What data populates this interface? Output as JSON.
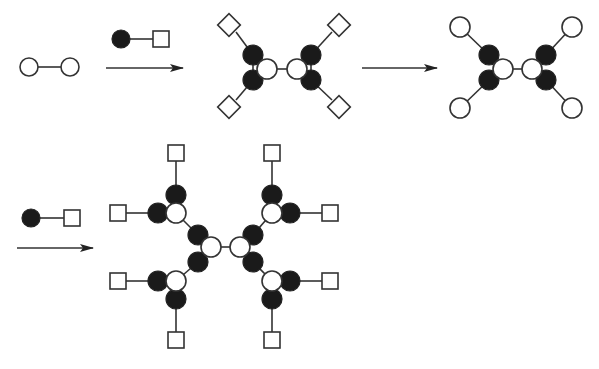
{
  "diagram": {
    "title": "",
    "legend": {
      "open_circle": "core / reactive site",
      "filled_circle": "branching unit",
      "square": "protected terminal group",
      "diamond": "protected terminal group (rotated)"
    },
    "colors": {
      "line": "#333333",
      "filled": "#1a1a1a",
      "background": "#ffffff"
    },
    "stages": [
      {
        "id": "core",
        "label": "Core (two linked open circles)"
      },
      {
        "id": "reagent-1",
        "label": "Filled circle - square reagent"
      },
      {
        "id": "gen1-protected",
        "label": "Generation 1 with four diamond end groups"
      },
      {
        "id": "gen1-deprotected",
        "label": "Generation 1 with four open-circle end groups"
      },
      {
        "id": "reagent-2",
        "label": "Filled circle - square reagent"
      },
      {
        "id": "gen2-protected",
        "label": "Generation 2 with eight square end groups"
      }
    ],
    "arrows": [
      {
        "id": "arrow-1",
        "from": "core",
        "to": "gen1-protected"
      },
      {
        "id": "arrow-2",
        "from": "gen1-protected",
        "to": "gen1-deprotected"
      },
      {
        "id": "arrow-3",
        "from": "gen1-deprotected",
        "to": "gen2-protected"
      }
    ]
  }
}
